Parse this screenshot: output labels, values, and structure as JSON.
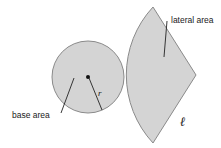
{
  "diagram": {
    "colors": {
      "fill": "#d4d4d4",
      "stroke": "#8a8a8a",
      "text": "#1a1a1a",
      "background": "#ffffff"
    },
    "base": {
      "label": "base area",
      "radius_label": "r",
      "shape": "circle"
    },
    "lateral": {
      "label": "lateral area",
      "slant_label": "ℓ",
      "shape": "sector"
    }
  }
}
